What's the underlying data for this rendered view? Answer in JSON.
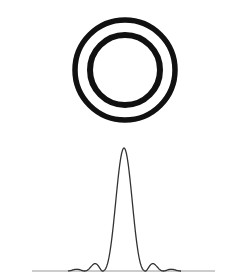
{
  "diagram": {
    "rings": {
      "count": 2,
      "color": "#111111"
    },
    "intensity_profile": {
      "curve_color": "#333333",
      "baseline_color": "#999999",
      "function": "airy-disk intensity (central peak with one visible secondary lobe on each side)",
      "central_peak_relative_height": 1.0,
      "secondary_lobe_relative_height": 0.06
    }
  }
}
